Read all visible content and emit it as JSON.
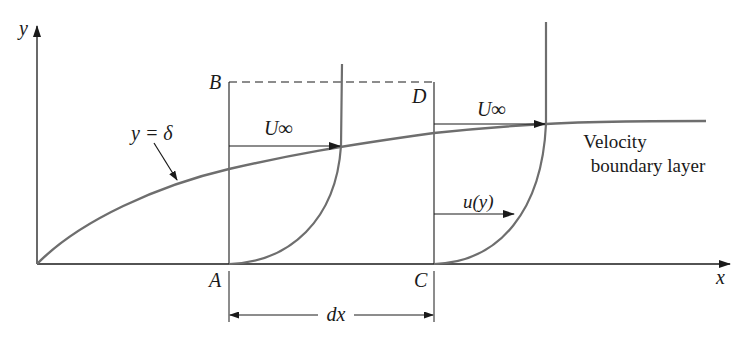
{
  "diagram": {
    "type": "velocity-boundary-layer-control-volume",
    "labels": {
      "y_axis": "y",
      "x_axis": "x",
      "point_a": "A",
      "point_b": "B",
      "point_c": "C",
      "point_d": "D",
      "boundary_curve": "y = δ",
      "free_stream_left": "U∞",
      "free_stream_right": "U∞",
      "local_velocity": "u(y)",
      "region_line1": "Velocity",
      "region_line2": "boundary layer",
      "dimension": "dx"
    },
    "colors": {
      "ink": "#1a1a1a",
      "curve": "#6e6e6e",
      "background": "#ffffff"
    }
  }
}
